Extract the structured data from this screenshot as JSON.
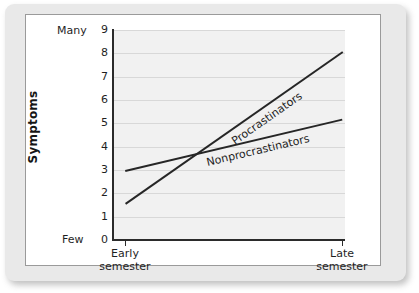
{
  "chart_data": {
    "type": "line",
    "title": "",
    "xlabel": "",
    "ylabel": "Symptoms",
    "ylim": [
      0,
      9
    ],
    "grid": true,
    "legend": "inline-along-lines",
    "x_categories": [
      "Early semester",
      "Late semester"
    ],
    "x_category_lines": [
      [
        "Early",
        "semester"
      ],
      [
        "Late",
        "semester"
      ]
    ],
    "y_ticks": [
      9,
      8,
      7,
      6,
      5,
      4,
      3,
      2,
      1,
      0
    ],
    "y_axis_low_label": "Few",
    "y_axis_high_label": "Many",
    "series": [
      {
        "name": "Procrastinators",
        "values": [
          1.6,
          8.1
        ]
      },
      {
        "name": "Nonprocrastinators",
        "values": [
          3.0,
          5.2
        ]
      }
    ],
    "colors": {
      "line": "#262626",
      "plot_background": "#f1f1f1",
      "gridline": "#d8d8d8",
      "axis": "#2b2b2b",
      "card_mat": "#e9e9e9",
      "panel": "#ffffff"
    }
  }
}
